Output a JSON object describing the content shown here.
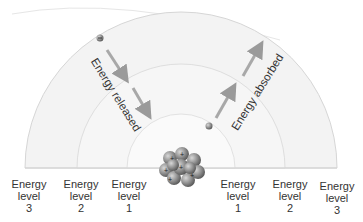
{
  "diagram": {
    "title": "",
    "annotations": {
      "released": "Energy released",
      "absorbed": "Energy absorbed"
    },
    "levels_left": [
      {
        "line1": "Energy",
        "line2": "level",
        "num": "3"
      },
      {
        "line1": "Energy",
        "line2": "level",
        "num": "2"
      },
      {
        "line1": "Energy",
        "line2": "level",
        "num": "1"
      }
    ],
    "levels_right": [
      {
        "line1": "Energy",
        "line2": "level",
        "num": "1"
      },
      {
        "line1": "Energy",
        "line2": "level",
        "num": "2"
      },
      {
        "line1": "Energy",
        "line2": "level",
        "num": "3"
      }
    ],
    "nucleus_charge_symbol": "+",
    "electron_charge_symbol": "−",
    "colors": {
      "shell": "#f4f4f4",
      "shell_edge": "#d8d8d8",
      "arrow": "#9a9a9a",
      "nucleus": "#7a7a7a"
    }
  }
}
